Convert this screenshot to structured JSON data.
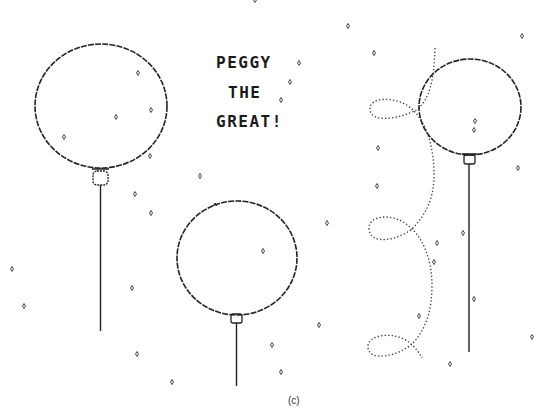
{
  "title": {
    "lines": [
      "PEGGY",
      "THE",
      "GREAT!"
    ]
  },
  "caption": "(c)",
  "colors": {
    "ink": "#222222",
    "background": "#ffffff"
  },
  "balloons": [
    {
      "name": "balloon-left",
      "cx": 101,
      "cy": 106,
      "rx": 66,
      "ry": 62,
      "knot_y": 178,
      "string_end_y": 331
    },
    {
      "name": "balloon-middle",
      "cx": 237,
      "cy": 258,
      "rx": 60,
      "ry": 57,
      "knot_y": 319,
      "string_end_y": 385
    },
    {
      "name": "balloon-right",
      "cx": 470,
      "cy": 107,
      "rx": 51,
      "ry": 48,
      "knot_y": 160,
      "string_end_y": 352
    }
  ],
  "sparkles": [
    [
      255,
      0
    ],
    [
      348,
      26
    ],
    [
      374,
      53
    ],
    [
      522,
      36
    ],
    [
      299,
      63
    ],
    [
      290,
      82
    ],
    [
      281,
      100
    ],
    [
      138,
      73
    ],
    [
      151,
      110
    ],
    [
      64,
      137
    ],
    [
      150,
      156
    ],
    [
      116,
      117
    ],
    [
      200,
      176
    ],
    [
      135,
      194
    ],
    [
      151,
      213
    ],
    [
      378,
      148
    ],
    [
      377,
      186
    ],
    [
      327,
      223
    ],
    [
      263,
      251
    ],
    [
      475,
      121
    ],
    [
      474,
      130
    ],
    [
      518,
      168
    ],
    [
      463,
      233
    ],
    [
      437,
      243
    ],
    [
      434,
      262
    ],
    [
      474,
      299
    ],
    [
      532,
      337
    ],
    [
      450,
      364
    ],
    [
      419,
      316
    ],
    [
      319,
      325
    ],
    [
      272,
      345
    ],
    [
      281,
      372
    ],
    [
      12,
      269
    ],
    [
      24,
      306
    ],
    [
      132,
      288
    ],
    [
      137,
      354
    ],
    [
      172,
      382
    ]
  ]
}
